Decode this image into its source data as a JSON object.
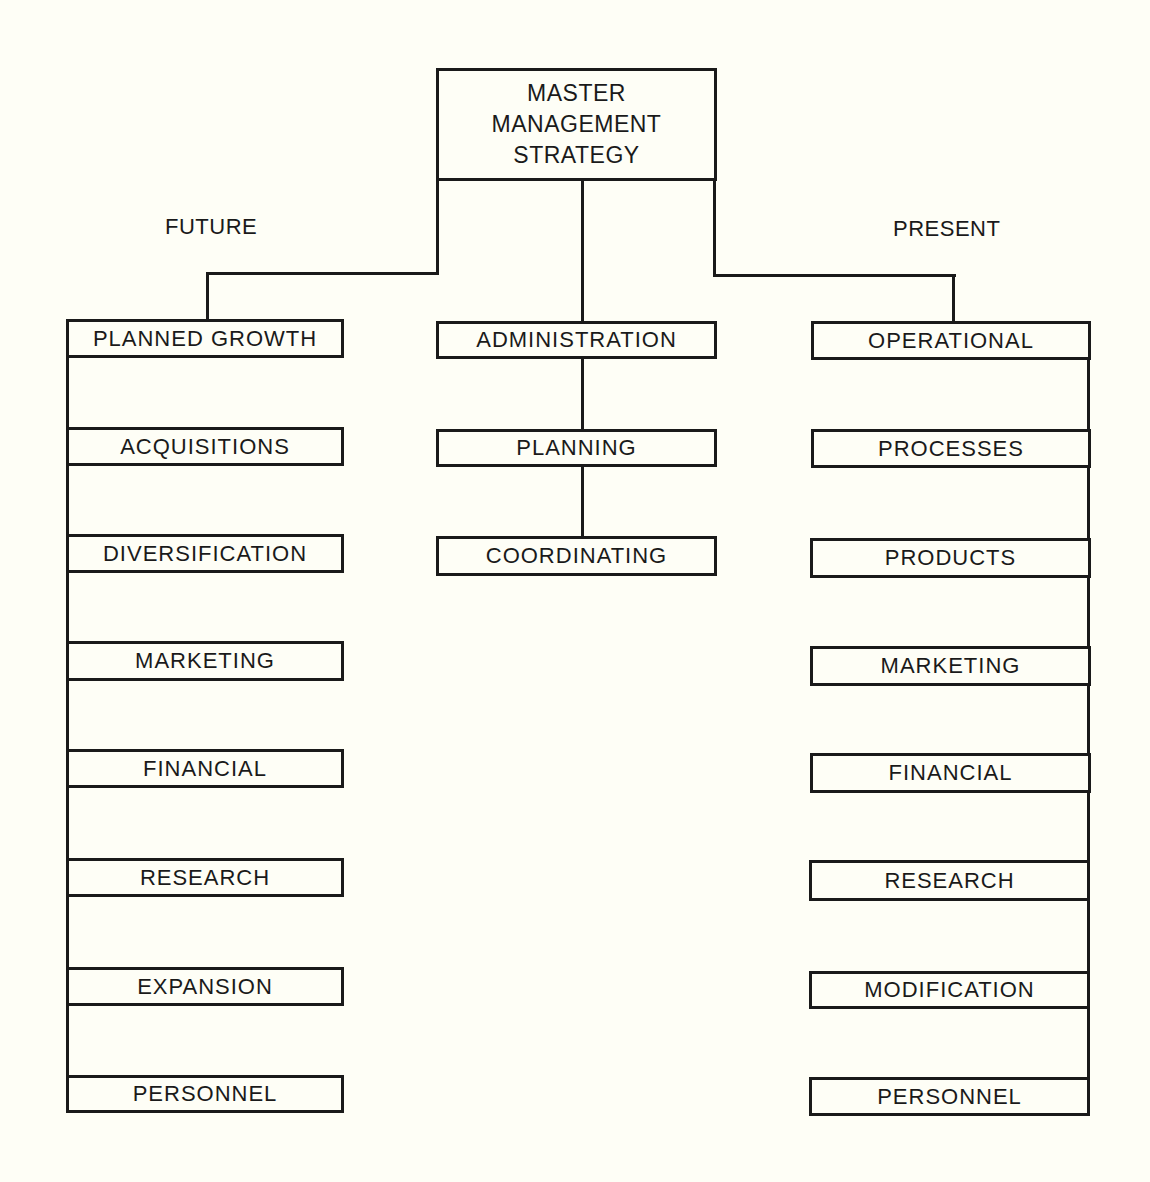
{
  "diagram": {
    "root": {
      "lines": [
        "MASTER",
        "MANAGEMENT",
        "STRATEGY"
      ]
    },
    "future": {
      "label": "FUTURE",
      "items": [
        {
          "label": "PLANNED GROWTH"
        },
        {
          "label": "ACQUISITIONS"
        },
        {
          "label": "DIVERSIFICATION"
        },
        {
          "label": "MARKETING"
        },
        {
          "label": "FINANCIAL"
        },
        {
          "label": "RESEARCH"
        },
        {
          "label": "EXPANSION"
        },
        {
          "label": "PERSONNEL"
        }
      ]
    },
    "center": {
      "items": [
        {
          "label": "ADMINISTRATION"
        },
        {
          "label": "PLANNING"
        },
        {
          "label": "COORDINATING"
        }
      ]
    },
    "present": {
      "label": "PRESENT",
      "items": [
        {
          "label": "OPERATIONAL"
        },
        {
          "label": "PROCESSES"
        },
        {
          "label": "PRODUCTS"
        },
        {
          "label": "MARKETING"
        },
        {
          "label": "FINANCIAL"
        },
        {
          "label": "RESEARCH"
        },
        {
          "label": "MODIFICATION"
        },
        {
          "label": "PERSONNEL"
        }
      ]
    },
    "colors": {
      "ink": "#1a1a1a",
      "paper": "#fefef6"
    }
  }
}
